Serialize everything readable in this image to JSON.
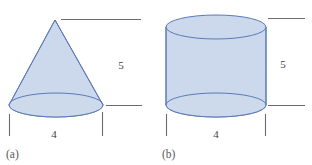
{
  "figure": {
    "background_color": "#ffffff",
    "shape_fill_color": "#ccd9ec",
    "shape_stroke_color": "#5b7ab5",
    "dimension_line_color": "#6b6b6b",
    "label_text_color": "#58585a",
    "dimension_text_color": "#3f3f3f",
    "panels": [
      {
        "id": "cone",
        "panel_label": "(a)",
        "shape_name": "cone",
        "height_label": "5",
        "width_label": "4"
      },
      {
        "id": "cylinder",
        "panel_label": "(b)",
        "shape_name": "cylinder",
        "height_label": "5",
        "width_label": "4"
      }
    ]
  }
}
